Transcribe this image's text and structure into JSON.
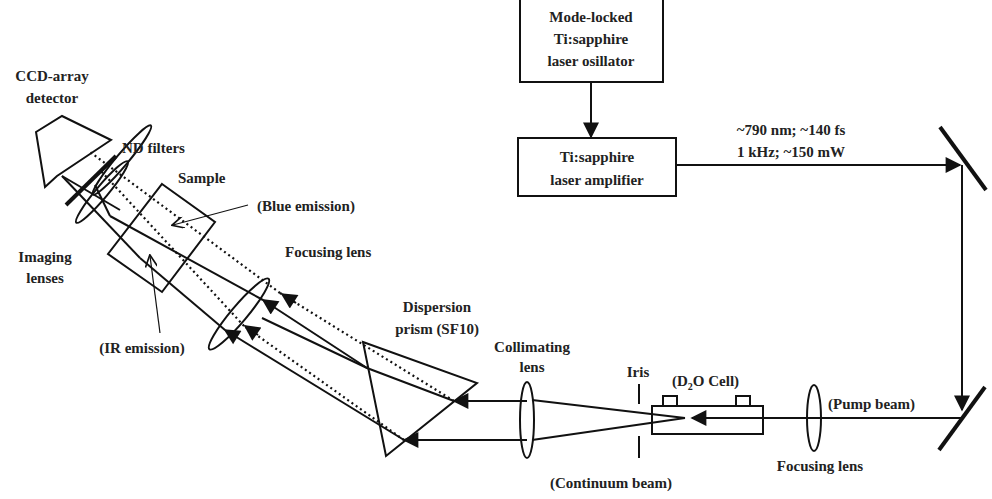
{
  "diagram": {
    "components": {
      "oscillator": {
        "lines": [
          "Mode-locked",
          "Ti:sapphire",
          "laser osillator"
        ]
      },
      "amplifier": {
        "lines": [
          "Ti:sapphire",
          "laser amplifier"
        ]
      },
      "beam_specs": {
        "lines": [
          "~790 nm; ~140 fs",
          "1 kHz; ~150 mW"
        ]
      },
      "pump_beam": "(Pump beam)",
      "focusing_lens_right": "Focusing lens",
      "d2o_cell": {
        "prefix": "(D",
        "subscript": "2",
        "suffix": "O Cell)"
      },
      "iris": "Iris",
      "continuum_beam": "(Continuum beam)",
      "collimating_lens": {
        "lines": [
          "Collimating",
          "lens"
        ]
      },
      "dispersion_prism": {
        "lines": [
          "Dispersion",
          "prism (SF10)"
        ]
      },
      "focusing_lens_left": "Focusing lens",
      "blue_emission": "(Blue emission)",
      "ir_emission": "(IR emission)",
      "sample": "Sample",
      "nd_filters": "ND filters",
      "imaging_lenses": {
        "lines": [
          "Imaging",
          "lenses"
        ]
      },
      "ccd_detector": {
        "lines": [
          "CCD-array",
          "detector"
        ]
      }
    },
    "colors": {
      "line": "#111111",
      "text": "#222222",
      "background": "#ffffff"
    }
  }
}
